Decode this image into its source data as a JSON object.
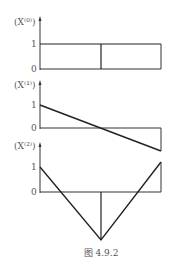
{
  "figure": {
    "caption": "图 4.9.2",
    "line_color": "#222222",
    "axis_color": "#333333",
    "panels": [
      {
        "label": "(X⁽⁰⁾)",
        "tick_one": "1",
        "tick_zero": "0",
        "description": "Constant value 1 over the interval, with a vertical line at the midpoint"
      },
      {
        "label": "(X⁽¹⁾)",
        "tick_one": "1",
        "tick_zero": "0",
        "description": "Linear decreasing from 1 at left to -1 at right, crossing zero at midpoint"
      },
      {
        "label": "(X⁽²⁾)",
        "tick_one": "1",
        "tick_zero": "0",
        "description": "V-shape: from 1 at left down to minimum at midpoint, back up to 1 at right"
      }
    ]
  }
}
